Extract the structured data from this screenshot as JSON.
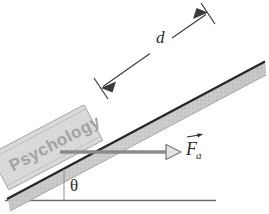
{
  "figure": {
    "type": "physics-free-body-diagram",
    "background_color": "#ffffff"
  },
  "labels": {
    "distance": "d",
    "angle": "θ",
    "force_symbol": "F",
    "force_subscript": "a",
    "block_text": "Psychology"
  },
  "colors": {
    "incline_edge": "#2a2a2a",
    "incline_body": "#c6c6c6",
    "block_fill": "#d8d8d8",
    "block_edge": "#8d8d8d",
    "ground_line": "#6e6e6e",
    "dimension_line": "#3a3a3a",
    "force_arrow": "#8a8a8a",
    "text": "#2b2b2b"
  },
  "geometry": {
    "incline_angle_deg": 35,
    "incline_base_point": [
      8,
      198
    ],
    "incline_top_point": [
      265,
      62
    ],
    "ground_line_start": [
      5,
      200
    ],
    "ground_line_end": [
      216,
      200
    ],
    "dimension_line_start": [
      101,
      88
    ],
    "dimension_line_end": [
      208,
      13
    ],
    "force_arrow_start": [
      60,
      152
    ],
    "force_arrow_end": [
      178,
      152
    ]
  }
}
